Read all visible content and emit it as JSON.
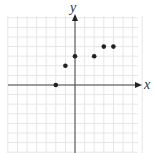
{
  "chart_data": {
    "type": "scatter",
    "title": "",
    "xlabel": "x",
    "ylabel": "y",
    "xlim": [
      -7,
      7
    ],
    "ylim": [
      -7,
      7
    ],
    "grid": true,
    "legend": null,
    "points": [
      {
        "x": -2,
        "y": 0
      },
      {
        "x": -1,
        "y": 2
      },
      {
        "x": 0,
        "y": 3
      },
      {
        "x": 2,
        "y": 3
      },
      {
        "x": 3,
        "y": 4
      },
      {
        "x": 4,
        "y": 4
      }
    ]
  },
  "labels": {
    "x_axis": "x",
    "y_axis": "y"
  },
  "colors": {
    "grid": "#e6e6e6",
    "axis": "#444444",
    "point": "#222222"
  }
}
